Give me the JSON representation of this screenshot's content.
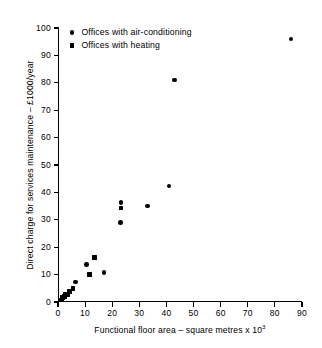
{
  "chart_data": {
    "type": "scatter",
    "title": "",
    "xlabel": "Functional floor area – square metres x 10",
    "xlabel_exponent": "3",
    "ylabel": "Direct charge for services maintenance – £1000/year",
    "xlim": [
      0,
      90
    ],
    "ylim": [
      0,
      100
    ],
    "xticks": [
      0,
      10,
      20,
      30,
      40,
      50,
      60,
      70,
      80,
      90
    ],
    "yticks": [
      0,
      10,
      20,
      30,
      40,
      50,
      60,
      70,
      80,
      90,
      100
    ],
    "grid": false,
    "legend_position": "top-left-inside",
    "series": [
      {
        "name": "Offices with air-conditioning",
        "marker": "circle",
        "color": "#000000",
        "points": [
          {
            "x": 6.5,
            "y": 7.3
          },
          {
            "x": 10.5,
            "y": 13.7
          },
          {
            "x": 17.0,
            "y": 10.7
          },
          {
            "x": 23.0,
            "y": 29.0
          },
          {
            "x": 23.2,
            "y": 36.3
          },
          {
            "x": 33.0,
            "y": 35.0
          },
          {
            "x": 41.0,
            "y": 42.3
          },
          {
            "x": 43.0,
            "y": 81.0
          },
          {
            "x": 86.0,
            "y": 96.0
          }
        ]
      },
      {
        "name": "Offices with heating",
        "marker": "square",
        "color": "#000000",
        "points": [
          {
            "x": 1.2,
            "y": 0.8
          },
          {
            "x": 1.6,
            "y": 1.7
          },
          {
            "x": 2.4,
            "y": 2.0
          },
          {
            "x": 2.6,
            "y": 2.8
          },
          {
            "x": 3.4,
            "y": 2.5
          },
          {
            "x": 4.2,
            "y": 3.8
          },
          {
            "x": 5.6,
            "y": 5.0
          },
          {
            "x": 11.6,
            "y": 10.0
          },
          {
            "x": 13.4,
            "y": 16.2
          },
          {
            "x": 23.2,
            "y": 34.3
          }
        ]
      }
    ]
  },
  "legend": {
    "items": [
      {
        "label": "Offices with air-conditioning",
        "marker": "circle"
      },
      {
        "label": "Offices with heating",
        "marker": "square"
      }
    ]
  }
}
